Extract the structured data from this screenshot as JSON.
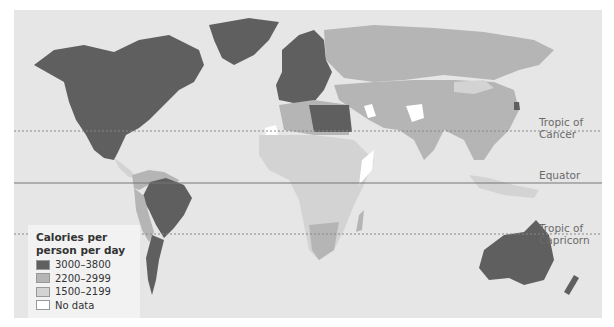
{
  "map": {
    "title": "Calories per person per day",
    "lines": {
      "tropic_of_cancer": {
        "label_line1": "Tropic of",
        "label_line2": "Cancer"
      },
      "equator": {
        "label": "Equator"
      },
      "tropic_of_capricorn": {
        "label_line1": "Tropic of",
        "label_line2": "Capricorn"
      }
    },
    "colors": {
      "ocean": "#e6e6e6",
      "high": "#5f5f5f",
      "mid": "#b5b5b5",
      "low": "#d3d3d3",
      "no_data": "#ffffff"
    },
    "regions": {
      "high_3000_3800": [
        "North America (USA, Canada)",
        "Mexico",
        "Greenland",
        "Western Europe",
        "Scandinavia",
        "Libya",
        "Egypt",
        "Turkey",
        "Brazil",
        "Argentina",
        "Paraguay",
        "Australia",
        "New Zealand",
        "South Korea"
      ],
      "mid_2200_2999": [
        "Russia",
        "China",
        "Central Asia",
        "Middle East",
        "Northern Africa",
        "India",
        "South America (others)",
        "Southern Africa",
        "Southeast Asia"
      ],
      "low_1500_2199": [
        "Sub-Saharan Africa",
        "Mongolia",
        "Central America",
        "Indonesia"
      ],
      "no_data": [
        "Western Sahara",
        "Afghanistan",
        "Iraq",
        "Somalia"
      ]
    }
  },
  "legend": {
    "title_line1": "Calories per",
    "title_line2": "person per day",
    "items": [
      {
        "label": "3000–3800",
        "color": "#5f5f5f"
      },
      {
        "label": "2200–2999",
        "color": "#b5b5b5"
      },
      {
        "label": "1500–2199",
        "color": "#d3d3d3"
      },
      {
        "label": "No data",
        "color": "#ffffff"
      }
    ]
  }
}
